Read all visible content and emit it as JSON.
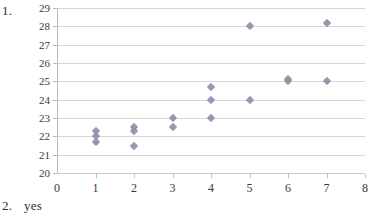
{
  "worksheet": {
    "item1_label": "1.",
    "item2_label": "2.",
    "item2_answer": "yes"
  },
  "colors": {
    "marker": "#8e8fa8",
    "gridline": "#d6d6d6",
    "axis": "#b8b8b8",
    "text": "#3a3a3a",
    "background": "#ffffff"
  },
  "chart_data": {
    "type": "scatter",
    "title": "",
    "xlabel": "",
    "ylabel": "",
    "xlim": [
      0,
      8
    ],
    "ylim": [
      20,
      29
    ],
    "xticks": [
      0,
      1,
      2,
      3,
      4,
      5,
      6,
      7,
      8
    ],
    "yticks": [
      20,
      21,
      22,
      23,
      24,
      25,
      26,
      27,
      28,
      29
    ],
    "xtick_labels": [
      "0",
      "1",
      "2",
      "3",
      "4",
      "5",
      "6",
      "7",
      "8"
    ],
    "ytick_labels": [
      "20",
      "21",
      "22",
      "23",
      "24",
      "25",
      "26",
      "27",
      "28",
      "29"
    ],
    "grid": "horizontal",
    "legend": "none",
    "marker": "diamond",
    "series": [
      {
        "name": "series1",
        "points": [
          {
            "x": 1,
            "y": 22.3
          },
          {
            "x": 1,
            "y": 22.0
          },
          {
            "x": 1,
            "y": 21.7
          },
          {
            "x": 2,
            "y": 22.5
          },
          {
            "x": 2,
            "y": 22.3
          },
          {
            "x": 2,
            "y": 21.5
          },
          {
            "x": 3,
            "y": 23.0
          },
          {
            "x": 3,
            "y": 22.5
          },
          {
            "x": 4,
            "y": 24.7
          },
          {
            "x": 4,
            "y": 24.0
          },
          {
            "x": 4,
            "y": 23.0
          },
          {
            "x": 5,
            "y": 28.0
          },
          {
            "x": 5,
            "y": 24.0
          },
          {
            "x": 6,
            "y": 25.15
          },
          {
            "x": 6,
            "y": 25.0
          },
          {
            "x": 7,
            "y": 28.2
          },
          {
            "x": 7,
            "y": 25.0
          }
        ]
      }
    ]
  }
}
